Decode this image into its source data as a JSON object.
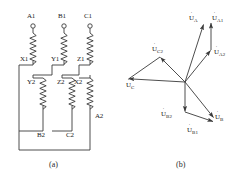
{
  "figure": {
    "title": "",
    "subfigures": [
      {
        "id": "a",
        "caption": "(a)",
        "description": "three-phase winding connection diagram"
      },
      {
        "id": "b",
        "caption": "(b)",
        "description": "phasor diagram of winding voltages"
      }
    ]
  },
  "circuit": {
    "terminals": [
      {
        "name": "A1",
        "label": "A1"
      },
      {
        "name": "B1",
        "label": "B1"
      },
      {
        "name": "C1",
        "label": "C1"
      }
    ],
    "coil_labels_upper": [
      {
        "name": "X1",
        "label": "X1"
      },
      {
        "name": "Y1",
        "label": "Y1"
      },
      {
        "name": "Z1",
        "label": "Z1"
      }
    ],
    "coil_labels_lower_top": [
      {
        "name": "Y2",
        "label": "Y2"
      },
      {
        "name": "Z2",
        "label": "Z2"
      },
      {
        "name": "X2",
        "label": "X2"
      }
    ],
    "coil_labels_lower_bottom": [
      {
        "name": "B2",
        "label": "B2"
      },
      {
        "name": "C2",
        "label": "C2"
      },
      {
        "name": "A2",
        "label": "A2"
      }
    ]
  },
  "phasors": {
    "items": [
      {
        "name": "U_A",
        "base": "U",
        "sub": "A",
        "angle_deg": 72,
        "length": 62
      },
      {
        "name": "U_A1",
        "base": "U",
        "sub": "A1",
        "angle_deg": 84,
        "length": 60
      },
      {
        "name": "U_A2",
        "base": "U",
        "sub": "A2",
        "angle_deg": 40,
        "length": 34
      },
      {
        "name": "U_C2",
        "base": "U",
        "sub": "C2",
        "angle_deg": 160,
        "length": 38
      },
      {
        "name": "U_C",
        "base": "U",
        "sub": "C",
        "angle_deg": 188,
        "length": 62
      },
      {
        "name": "U_B2",
        "base": "U",
        "sub": "B2",
        "angle_deg": -84,
        "length": 34
      },
      {
        "name": "U_B",
        "base": "U",
        "sub": "B",
        "angle_deg": -50,
        "length": 58
      },
      {
        "name": "U_B1",
        "base": "U",
        "sub": "B1",
        "angle_deg": -62,
        "length": 60
      }
    ],
    "origin": {
      "x": 185,
      "y": 82
    }
  },
  "colors": {
    "line": "#3a3a3a",
    "text": "#1a1a1a",
    "background": "#ffffff"
  }
}
